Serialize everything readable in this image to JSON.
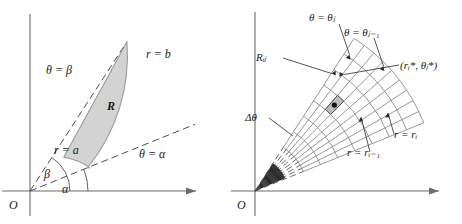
{
  "figure": {
    "background_color": "#ffffff",
    "line_color": "#555555",
    "axis_color": "#6b6b6b",
    "region_fill": "#d3d3d3",
    "region_stroke": "#9a9a9a",
    "grid_color": "#8c8c8c",
    "label_color": "#1a1a1a"
  },
  "left_panel": {
    "name": "polar-region-diagram",
    "origin_label": "O",
    "region_label": "R",
    "labels": {
      "theta_beta": "θ = β",
      "theta_alpha": "θ = α",
      "r_equals_b": "r = b",
      "r_equals_a": "r = a",
      "angle_beta": "β",
      "angle_alpha": "α"
    },
    "geometry": {
      "origin_x": 30,
      "origin_y": 191,
      "inner_radius": 62,
      "outer_radius": 178,
      "alpha_deg": 22,
      "beta_deg": 57
    }
  },
  "right_panel": {
    "name": "polar-subdivision-diagram",
    "origin_label": "O",
    "labels": {
      "theta_theta_j": "θ = θⱼ",
      "theta_theta_j_minus_1": "θ = θⱼ₋₁",
      "subrectangle": "Rᵢⱼ",
      "sample_point": "(rᵢ*, θⱼ*)",
      "delta_theta": "Δθ",
      "r_equals_ri": "r = rᵢ",
      "r_equals_ri_minus_1": "r = rᵢ₋₁"
    },
    "geometry": {
      "origin_x": 24,
      "origin_y": 191,
      "inner_radius": 52,
      "outer_radius": 182,
      "alpha_deg": 22,
      "beta_deg": 57,
      "radial_divisions": 7,
      "angular_divisions": 9
    }
  }
}
